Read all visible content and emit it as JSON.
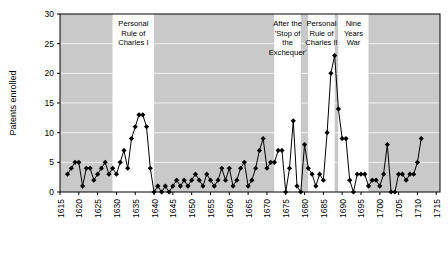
{
  "chart": {
    "ylabel": "Patents enrolled",
    "xlabel": "",
    "title": "",
    "y_ticks": [
      0,
      5,
      10,
      15,
      20,
      25,
      30
    ],
    "x_ticks": [
      1615,
      1620,
      1625,
      1630,
      1635,
      1640,
      1645,
      1650,
      1655,
      1660,
      1665,
      1670,
      1675,
      1680,
      1685,
      1690,
      1695,
      1700,
      1705,
      1710,
      1715
    ],
    "colors": {
      "band_shaded": "#c9c9c9",
      "band_plain": "#ffffff",
      "line": "#000000",
      "marker": "#000000",
      "gridline": "#ffffff",
      "axis": "#000000"
    },
    "bands": [
      {
        "label": "",
        "start": 1615,
        "end": 1629,
        "shaded": true
      },
      {
        "label": "Personal Rule of Charles I",
        "start": 1629,
        "end": 1640,
        "shaded": false
      },
      {
        "label": "",
        "start": 1640,
        "end": 1672,
        "shaded": true
      },
      {
        "label": "After the 'Stop of the Exchequer'",
        "start": 1672,
        "end": 1679,
        "shaded": false
      },
      {
        "label": "",
        "start": 1679,
        "end": 1681,
        "shaded": true
      },
      {
        "label": "Personal Rule of Charles II",
        "start": 1681,
        "end": 1688,
        "shaded": false
      },
      {
        "label": "",
        "start": 1688,
        "end": 1689,
        "shaded": true
      },
      {
        "label": "Nine Years War",
        "start": 1689,
        "end": 1697,
        "shaded": false
      },
      {
        "label": "",
        "start": 1697,
        "end": 1716,
        "shaded": true
      }
    ]
  },
  "chart_data": {
    "type": "line",
    "title": "",
    "xlabel": "",
    "ylabel": "Patents enrolled",
    "xlim": [
      1615,
      1716
    ],
    "ylim": [
      0,
      30
    ],
    "grid": true,
    "legend": null,
    "marker": "diamond",
    "x": [
      1617,
      1618,
      1619,
      1620,
      1621,
      1622,
      1623,
      1624,
      1625,
      1626,
      1627,
      1628,
      1629,
      1630,
      1631,
      1632,
      1633,
      1634,
      1635,
      1636,
      1637,
      1638,
      1639,
      1640,
      1641,
      1642,
      1643,
      1644,
      1645,
      1646,
      1647,
      1648,
      1649,
      1650,
      1651,
      1652,
      1653,
      1654,
      1655,
      1656,
      1657,
      1658,
      1659,
      1660,
      1661,
      1662,
      1663,
      1664,
      1665,
      1666,
      1667,
      1668,
      1669,
      1670,
      1671,
      1672,
      1673,
      1674,
      1675,
      1676,
      1677,
      1678,
      1679,
      1680,
      1681,
      1682,
      1683,
      1684,
      1685,
      1686,
      1687,
      1688,
      1689,
      1690,
      1691,
      1692,
      1693,
      1694,
      1695,
      1696,
      1697,
      1698,
      1699,
      1700,
      1701,
      1702,
      1703,
      1704,
      1705,
      1706,
      1707,
      1708,
      1709,
      1710,
      1711,
      1712,
      1713,
      1714,
      1715
    ],
    "y": [
      3,
      4,
      5,
      5,
      1,
      4,
      4,
      2,
      3,
      4,
      5,
      3,
      4,
      3,
      5,
      7,
      4,
      9,
      11,
      13,
      13,
      11,
      4,
      0,
      1,
      0,
      1,
      0,
      1,
      2,
      1,
      2,
      1,
      2,
      3,
      2,
      1,
      3,
      2,
      1,
      2,
      4,
      2,
      4,
      1,
      2,
      4,
      5,
      1,
      2,
      4,
      7,
      9,
      4,
      5,
      5,
      7,
      7,
      0,
      4,
      12,
      1,
      0,
      8,
      4,
      3,
      1,
      3,
      2,
      10,
      20,
      23,
      14,
      9,
      9,
      2,
      0,
      3,
      3,
      3,
      1,
      2,
      2,
      1,
      3,
      8,
      0,
      0,
      3,
      3,
      2,
      3,
      3,
      5,
      9
    ],
    "bands": [
      {
        "label": "Personal Rule of Charles I",
        "start": 1629,
        "end": 1640
      },
      {
        "label": "After the 'Stop of the Exchequer'",
        "start": 1672,
        "end": 1679
      },
      {
        "label": "Personal Rule of Charles II",
        "start": 1681,
        "end": 1688
      },
      {
        "label": "Nine Years War",
        "start": 1689,
        "end": 1697
      }
    ],
    "y_ticks": [
      0,
      5,
      10,
      15,
      20,
      25,
      30
    ],
    "x_ticks": [
      1615,
      1620,
      1625,
      1630,
      1635,
      1640,
      1645,
      1650,
      1655,
      1660,
      1665,
      1670,
      1675,
      1680,
      1685,
      1690,
      1695,
      1700,
      1705,
      1710,
      1715
    ]
  }
}
